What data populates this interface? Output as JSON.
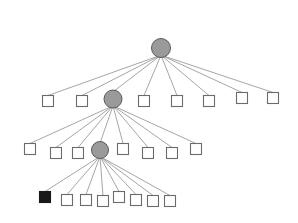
{
  "diagram": {
    "type": "tree",
    "background_color": "#ffffff",
    "width": 298,
    "height": 223,
    "palette": {
      "edge_color": "#8e8e8e",
      "square_fill": "#ffffff",
      "square_stroke": "#6b6b6b",
      "square_filled_fill": "#191919",
      "circle_fill": "#9a9a9a",
      "circle_stroke": "#5a5a5a"
    },
    "node_shapes": {
      "circle": "internal-node",
      "square": "leaf-node",
      "square_filled": "highlighted-leaf-node"
    },
    "nodes": [
      {
        "id": "root",
        "shape": "circle",
        "cx": 161,
        "cy": 48,
        "r": 9.5,
        "level": 0
      },
      {
        "id": "n1-0",
        "shape": "square",
        "cx": 48,
        "cy": 101,
        "size": 11,
        "level": 1
      },
      {
        "id": "n1-1",
        "shape": "square",
        "cx": 82,
        "cy": 101,
        "size": 11,
        "level": 1
      },
      {
        "id": "n1-2",
        "shape": "circle",
        "cx": 113,
        "cy": 99,
        "r": 9.0,
        "level": 1
      },
      {
        "id": "n1-3",
        "shape": "square",
        "cx": 144,
        "cy": 101,
        "size": 11,
        "level": 1
      },
      {
        "id": "n1-4",
        "shape": "square",
        "cx": 177,
        "cy": 101,
        "size": 11,
        "level": 1
      },
      {
        "id": "n1-5",
        "shape": "square",
        "cx": 209,
        "cy": 101,
        "size": 11,
        "level": 1
      },
      {
        "id": "n1-6",
        "shape": "square",
        "cx": 242,
        "cy": 98,
        "size": 11,
        "level": 1
      },
      {
        "id": "n1-7",
        "shape": "square",
        "cx": 273,
        "cy": 98,
        "size": 11,
        "level": 1
      },
      {
        "id": "n2-0",
        "shape": "square",
        "cx": 30,
        "cy": 149,
        "size": 11,
        "level": 2
      },
      {
        "id": "n2-1",
        "shape": "square",
        "cx": 56,
        "cy": 153,
        "size": 11,
        "level": 2
      },
      {
        "id": "n2-2",
        "shape": "square",
        "cx": 78,
        "cy": 153,
        "size": 11,
        "level": 2
      },
      {
        "id": "n2-3",
        "shape": "circle",
        "cx": 100,
        "cy": 150,
        "r": 8.5,
        "level": 2
      },
      {
        "id": "n2-4",
        "shape": "square",
        "cx": 123,
        "cy": 149,
        "size": 11,
        "level": 2
      },
      {
        "id": "n2-5",
        "shape": "square",
        "cx": 148,
        "cy": 153,
        "size": 11,
        "level": 2
      },
      {
        "id": "n2-6",
        "shape": "square",
        "cx": 172,
        "cy": 153,
        "size": 11,
        "level": 2
      },
      {
        "id": "n2-7",
        "shape": "square",
        "cx": 196,
        "cy": 149,
        "size": 11,
        "level": 2
      },
      {
        "id": "n3-0",
        "shape": "square_filled",
        "cx": 45,
        "cy": 197,
        "size": 11,
        "level": 3
      },
      {
        "id": "n3-1",
        "shape": "square",
        "cx": 67,
        "cy": 200,
        "size": 11,
        "level": 3
      },
      {
        "id": "n3-2",
        "shape": "square",
        "cx": 86,
        "cy": 200,
        "size": 11,
        "level": 3
      },
      {
        "id": "n3-3",
        "shape": "square",
        "cx": 103,
        "cy": 201,
        "size": 11,
        "level": 3
      },
      {
        "id": "n3-4",
        "shape": "square",
        "cx": 119,
        "cy": 197,
        "size": 11,
        "level": 3
      },
      {
        "id": "n3-5",
        "shape": "square",
        "cx": 136,
        "cy": 200,
        "size": 11,
        "level": 3
      },
      {
        "id": "n3-6",
        "shape": "square",
        "cx": 153,
        "cy": 201,
        "size": 11,
        "level": 3
      },
      {
        "id": "n3-7",
        "shape": "square",
        "cx": 170,
        "cy": 201,
        "size": 11,
        "level": 3
      }
    ],
    "edges": [
      {
        "from": "root",
        "to": "n1-0"
      },
      {
        "from": "root",
        "to": "n1-1"
      },
      {
        "from": "root",
        "to": "n1-2"
      },
      {
        "from": "root",
        "to": "n1-3"
      },
      {
        "from": "root",
        "to": "n1-4"
      },
      {
        "from": "root",
        "to": "n1-5"
      },
      {
        "from": "root",
        "to": "n1-6"
      },
      {
        "from": "root",
        "to": "n1-7"
      },
      {
        "from": "n1-2",
        "to": "n2-0"
      },
      {
        "from": "n1-2",
        "to": "n2-1"
      },
      {
        "from": "n1-2",
        "to": "n2-2"
      },
      {
        "from": "n1-2",
        "to": "n2-3"
      },
      {
        "from": "n1-2",
        "to": "n2-4"
      },
      {
        "from": "n1-2",
        "to": "n2-5"
      },
      {
        "from": "n1-2",
        "to": "n2-6"
      },
      {
        "from": "n1-2",
        "to": "n2-7"
      },
      {
        "from": "n2-3",
        "to": "n3-0"
      },
      {
        "from": "n2-3",
        "to": "n3-1"
      },
      {
        "from": "n2-3",
        "to": "n3-2"
      },
      {
        "from": "n2-3",
        "to": "n3-3"
      },
      {
        "from": "n2-3",
        "to": "n3-4"
      },
      {
        "from": "n2-3",
        "to": "n3-5"
      },
      {
        "from": "n2-3",
        "to": "n3-6"
      },
      {
        "from": "n2-3",
        "to": "n3-7"
      }
    ]
  }
}
